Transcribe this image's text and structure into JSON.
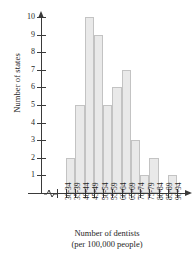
{
  "chart_data": {
    "type": "bar",
    "title": "",
    "subtitle": "",
    "xlabel": "Number of dentists",
    "xlabel_sub": "(per 100,000 people)",
    "ylabel": "Number of states",
    "categories": [
      "30-34",
      "35-39",
      "40-44",
      "45-49",
      "50-54",
      "55-59",
      "60-64",
      "65-69",
      "70-74",
      "75-79",
      "80-84",
      "85-89",
      "90-94"
    ],
    "values": [
      0,
      2,
      5,
      10,
      9,
      5,
      6,
      7,
      3,
      1,
      2,
      0,
      1
    ],
    "ylim": [
      0,
      10
    ],
    "yticks": [
      1,
      2,
      3,
      4,
      5,
      6,
      7,
      8,
      9,
      10
    ],
    "ytick_labels": [
      "1",
      "2",
      "3",
      "4",
      "5",
      "6",
      "7",
      "8",
      "9",
      "10"
    ],
    "grid": false,
    "legend": null,
    "axis_break": true,
    "bar_fill": "#e9e9e9",
    "bar_border": "#c3c3c3",
    "axis_color": "#3a3a3a"
  }
}
